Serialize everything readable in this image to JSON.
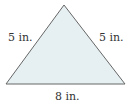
{
  "figure": {
    "shape": "isosceles-triangle",
    "fill_color": "#e6f0f2",
    "stroke_color": "#666666",
    "labels": {
      "left_side": "5 in.",
      "right_side": "5 in.",
      "base": "8 in."
    }
  }
}
